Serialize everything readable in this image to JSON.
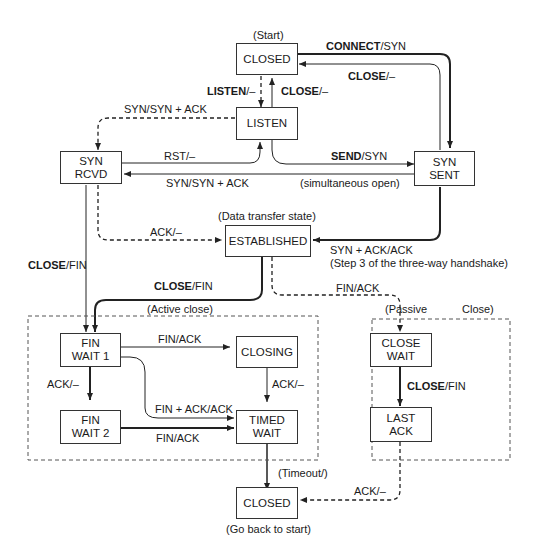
{
  "diagram": {
    "states": {
      "closed_top": "CLOSED",
      "listen": "LISTEN",
      "syn_rcvd_1": "SYN",
      "syn_rcvd_2": "RCVD",
      "syn_sent_1": "SYN",
      "syn_sent_2": "SENT",
      "established": "ESTABLISHED",
      "fin_wait1_1": "FIN",
      "fin_wait1_2": "WAIT 1",
      "fin_wait2_1": "FIN",
      "fin_wait2_2": "WAIT 2",
      "closing": "CLOSING",
      "timed_wait_1": "TIMED",
      "timed_wait_2": "WAIT",
      "close_wait_1": "CLOSE",
      "close_wait_2": "WAIT",
      "last_ack_1": "LAST",
      "last_ack_2": "ACK",
      "closed_bottom": "CLOSED"
    },
    "annotations": {
      "start": "(Start)",
      "data_transfer": "(Data transfer state)",
      "simultaneous_open": "(simultaneous open)",
      "step3": "(Step 3 of the three-way handshake)",
      "active_close": "(Active close)",
      "passive": "(Passive",
      "close_paren": "Close)",
      "timeout": "(Timeout/)",
      "go_back": "(Go back to start)"
    },
    "transitions": {
      "connect_bold": "CONNECT",
      "connect_rest": "/SYN",
      "close_top_bold": "CLOSE",
      "close_top_rest": "/–",
      "listen_bold": "LISTEN",
      "listen_rest": "/–",
      "close_listen_bold": "CLOSE",
      "close_listen_rest": "/–",
      "syn_synack": "SYN/SYN + ACK",
      "rst": "RST/–",
      "send_bold": "SEND",
      "send_rest": "/SYN",
      "syn_synack_2": "SYN/SYN + ACK",
      "ack_est": "ACK/–",
      "synack_ack": "SYN + ACK/ACK",
      "close_fin_left_bold": "CLOSE",
      "close_fin_left_rest": "/FIN",
      "close_fin_est_bold": "CLOSE",
      "close_fin_est_rest": "/FIN",
      "fin_ack_passive": "FIN/ACK",
      "fin_ack_closing": "FIN/ACK",
      "ack_fw2": "ACK/–",
      "ack_closing": "ACK/–",
      "fin_ack_ack": "FIN + ACK/ACK",
      "fin_ack_fw2": "FIN/ACK",
      "close_fin_cw_bold": "CLOSE",
      "close_fin_cw_rest": "/FIN",
      "ack_last": "ACK/–"
    }
  }
}
